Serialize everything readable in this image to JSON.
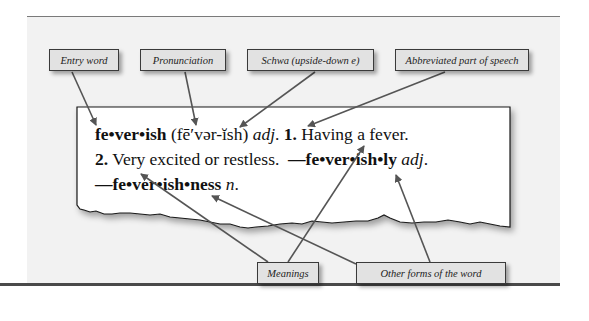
{
  "diagram": {
    "labels": {
      "entry_word": "Entry word",
      "pronunciation": "Pronunciation",
      "schwa": "Schwa (upside-down e)",
      "part_of_speech": "Abbreviated part of speech",
      "meanings": "Meanings",
      "other_forms": "Other forms of the word"
    },
    "entry": {
      "headword": "fe•ver•ish",
      "pronunciation": "(fē′vər-ĭsh)",
      "pos": "adj",
      "sense1_num": "1.",
      "sense1_text": "Having a fever.",
      "sense2_num": "2.",
      "sense2_text": "Very excited or restless.",
      "form1_dash": "—",
      "form1_word": "fe•ver•ish•ly",
      "form1_pos": "adj",
      "form2_dash": "—",
      "form2_word": "fe•ver•ish•ness",
      "form2_pos": "n"
    },
    "colors": {
      "panel_bg": "#f2f2f2",
      "label_bg": "#e2e2e2",
      "arrow": "#555555",
      "card_bg": "#ffffff"
    }
  }
}
